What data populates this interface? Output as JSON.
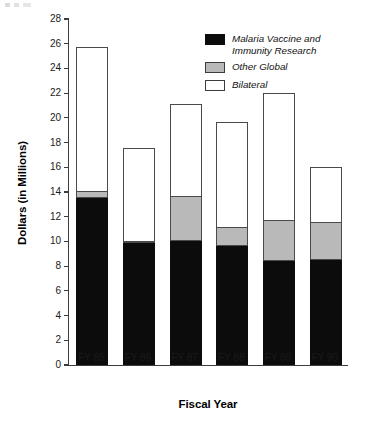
{
  "chart_data": {
    "type": "bar",
    "subtype": "stacked-vertical",
    "title": "",
    "xlabel": "Fiscal Year",
    "ylabel": "Dollars (in Millions)",
    "categories": [
      "FY 85",
      "FY 86",
      "FY 87",
      "FY 88",
      "FY 89",
      "FY 90"
    ],
    "series": [
      {
        "name": "Malaria Vaccine and Immunity Research",
        "color": "#0c0c0c",
        "values": [
          13.5,
          9.85,
          10.0,
          9.6,
          8.45,
          8.5
        ]
      },
      {
        "name": "Other Global",
        "color": "#b9b9b9",
        "values": [
          0.6,
          0.15,
          3.7,
          1.6,
          3.3,
          3.1
        ]
      },
      {
        "name": "Bilateral",
        "color": "#ffffff",
        "values": [
          11.6,
          7.6,
          7.4,
          8.5,
          10.25,
          4.4
        ]
      }
    ],
    "totals": [
      25.7,
      17.6,
      21.1,
      19.7,
      22.0,
      16.0
    ],
    "ylim": [
      0,
      28
    ],
    "ytick_step": 2,
    "yticks": [
      0,
      2,
      4,
      6,
      8,
      10,
      12,
      14,
      16,
      18,
      20,
      22,
      24,
      26,
      28
    ],
    "ytick_labels": [
      "0",
      "2",
      "4",
      "6",
      "8",
      "10",
      "12",
      "14",
      "16",
      "18",
      "20",
      "22",
      "24",
      "26",
      "28"
    ],
    "grid": false,
    "legend_position": "top-right",
    "legend_entries": [
      "Malaria Vaccine and Immunity Research",
      "Other Global",
      "Bilateral"
    ]
  },
  "legend": {
    "rows": [
      {
        "label": "Malaria Vaccine and\nImmunity Research",
        "swatch": "black-swatch"
      },
      {
        "label": "Other Global",
        "swatch": "gray-swatch"
      },
      {
        "label": "Bilateral",
        "swatch": "white-swatch"
      }
    ]
  }
}
